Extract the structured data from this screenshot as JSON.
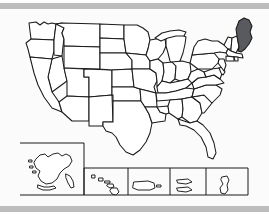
{
  "image": {
    "kind": "us-states-outline-map",
    "title": "Map of the United States with Maine highlighted",
    "background_color": "#fbfbfb",
    "page_background_color": "#ffffff",
    "frame_bar_color": "#bdbdbd",
    "outline_color": "#1a1a1a",
    "state_fill_color": "#ffffff",
    "highlight_fill_color": "#595960"
  },
  "highlight": {
    "state_name": "Maine",
    "state_code": "ME",
    "fill_color": "#595960",
    "region": "New England",
    "position": "northeast-corner"
  },
  "main_map": {
    "name": "contiguous-united-states",
    "label": "Contiguous United States",
    "state_count": 48
  },
  "insets": [
    {
      "id": "alaska",
      "label": "Alaska",
      "code": "AK",
      "box": {
        "x": 20,
        "y": 134,
        "w": 64,
        "h": 52
      }
    },
    {
      "id": "hawaii",
      "label": "Hawaii",
      "code": "HI",
      "box": {
        "x": 84,
        "y": 159,
        "w": 44,
        "h": 27
      }
    },
    {
      "id": "puerto-rico",
      "label": "Puerto Rico",
      "code": "PR",
      "box": {
        "x": 128,
        "y": 159,
        "w": 42,
        "h": 27
      }
    },
    {
      "id": "us-virgin-islands",
      "label": "U.S. Virgin Islands",
      "code": "VI",
      "box": {
        "x": 170,
        "y": 159,
        "w": 36,
        "h": 27
      }
    },
    {
      "id": "guam",
      "label": "Guam",
      "code": "GU",
      "box": {
        "x": 206,
        "y": 159,
        "w": 42,
        "h": 27
      }
    }
  ],
  "states": [
    {
      "code": "WA",
      "name": "Washington",
      "highlighted": false
    },
    {
      "code": "OR",
      "name": "Oregon",
      "highlighted": false
    },
    {
      "code": "CA",
      "name": "California",
      "highlighted": false
    },
    {
      "code": "NV",
      "name": "Nevada",
      "highlighted": false
    },
    {
      "code": "ID",
      "name": "Idaho",
      "highlighted": false
    },
    {
      "code": "MT",
      "name": "Montana",
      "highlighted": false
    },
    {
      "code": "WY",
      "name": "Wyoming",
      "highlighted": false
    },
    {
      "code": "UT",
      "name": "Utah",
      "highlighted": false
    },
    {
      "code": "AZ",
      "name": "Arizona",
      "highlighted": false
    },
    {
      "code": "CO",
      "name": "Colorado",
      "highlighted": false
    },
    {
      "code": "NM",
      "name": "New Mexico",
      "highlighted": false
    },
    {
      "code": "ND",
      "name": "North Dakota",
      "highlighted": false
    },
    {
      "code": "SD",
      "name": "South Dakota",
      "highlighted": false
    },
    {
      "code": "NE",
      "name": "Nebraska",
      "highlighted": false
    },
    {
      "code": "KS",
      "name": "Kansas",
      "highlighted": false
    },
    {
      "code": "OK",
      "name": "Oklahoma",
      "highlighted": false
    },
    {
      "code": "TX",
      "name": "Texas",
      "highlighted": false
    },
    {
      "code": "MN",
      "name": "Minnesota",
      "highlighted": false
    },
    {
      "code": "IA",
      "name": "Iowa",
      "highlighted": false
    },
    {
      "code": "MO",
      "name": "Missouri",
      "highlighted": false
    },
    {
      "code": "AR",
      "name": "Arkansas",
      "highlighted": false
    },
    {
      "code": "LA",
      "name": "Louisiana",
      "highlighted": false
    },
    {
      "code": "WI",
      "name": "Wisconsin",
      "highlighted": false
    },
    {
      "code": "IL",
      "name": "Illinois",
      "highlighted": false
    },
    {
      "code": "MS",
      "name": "Mississippi",
      "highlighted": false
    },
    {
      "code": "MI",
      "name": "Michigan",
      "highlighted": false
    },
    {
      "code": "IN",
      "name": "Indiana",
      "highlighted": false
    },
    {
      "code": "OH",
      "name": "Ohio",
      "highlighted": false
    },
    {
      "code": "KY",
      "name": "Kentucky",
      "highlighted": false
    },
    {
      "code": "TN",
      "name": "Tennessee",
      "highlighted": false
    },
    {
      "code": "AL",
      "name": "Alabama",
      "highlighted": false
    },
    {
      "code": "GA",
      "name": "Georgia",
      "highlighted": false
    },
    {
      "code": "FL",
      "name": "Florida",
      "highlighted": false
    },
    {
      "code": "SC",
      "name": "South Carolina",
      "highlighted": false
    },
    {
      "code": "NC",
      "name": "North Carolina",
      "highlighted": false
    },
    {
      "code": "VA",
      "name": "Virginia",
      "highlighted": false
    },
    {
      "code": "WV",
      "name": "West Virginia",
      "highlighted": false
    },
    {
      "code": "MD",
      "name": "Maryland",
      "highlighted": false
    },
    {
      "code": "DE",
      "name": "Delaware",
      "highlighted": false
    },
    {
      "code": "NJ",
      "name": "New Jersey",
      "highlighted": false
    },
    {
      "code": "PA",
      "name": "Pennsylvania",
      "highlighted": false
    },
    {
      "code": "NY",
      "name": "New York",
      "highlighted": false
    },
    {
      "code": "CT",
      "name": "Connecticut",
      "highlighted": false
    },
    {
      "code": "RI",
      "name": "Rhode Island",
      "highlighted": false
    },
    {
      "code": "MA",
      "name": "Massachusetts",
      "highlighted": false
    },
    {
      "code": "VT",
      "name": "Vermont",
      "highlighted": false
    },
    {
      "code": "NH",
      "name": "New Hampshire",
      "highlighted": false
    },
    {
      "code": "ME",
      "name": "Maine",
      "highlighted": true
    }
  ]
}
